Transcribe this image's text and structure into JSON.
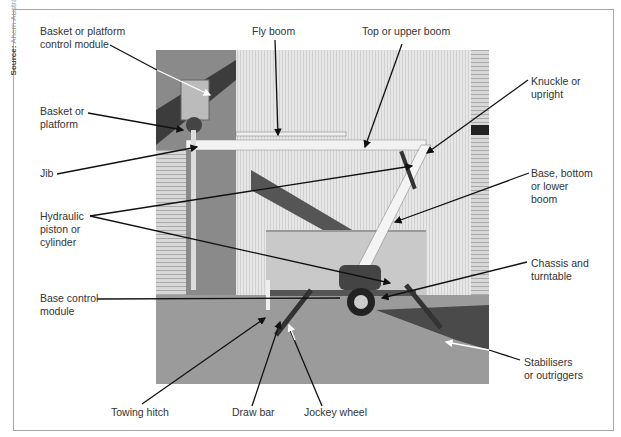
{
  "source": {
    "prefix": "Source:",
    "text": "Ahern Australia"
  },
  "labels": {
    "basket_control_module": "Basket or platform\ncontrol module",
    "basket_platform": "Basket or\nplatform",
    "jib": "Jib",
    "hydraulic_piston": "Hydraulic\npiston or\ncylinder",
    "base_control_module": "Base control\nmodule",
    "towing_hitch": "Towing hitch",
    "draw_bar": "Draw bar",
    "jockey_wheel": "Jockey wheel",
    "fly_boom": "Fly boom",
    "top_upper_boom": "Top or upper boom",
    "knuckle_upright": "Knuckle or\nupright",
    "base_lower_boom": "Base, bottom\nor lower\nboom",
    "chassis_turntable": "Chassis and\nturntable",
    "stabilisers": "Stabilisers\nor outriggers"
  },
  "photo": {
    "subject": "trailer-mounted boom lift",
    "brand_text": "Snorkel"
  }
}
